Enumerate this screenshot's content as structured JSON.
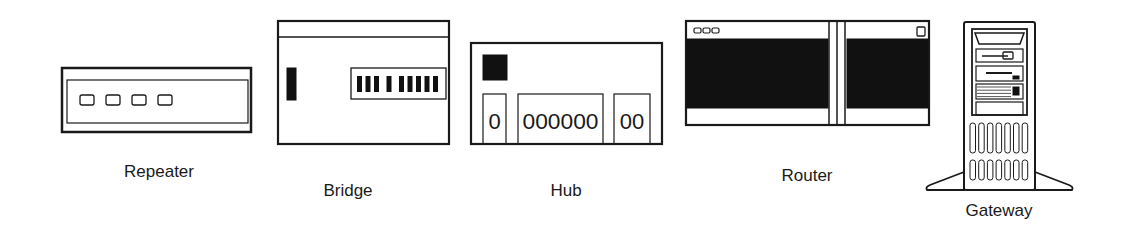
{
  "figure": {
    "colors": {
      "ink": "#1a1a1a",
      "background": "#ffffff",
      "panel_fill": "#111111"
    }
  },
  "devices": [
    {
      "id": "repeater",
      "label": "Repeater",
      "icon": "repeater-icon",
      "port_count": 4
    },
    {
      "id": "bridge",
      "label": "Bridge",
      "icon": "bridge-icon",
      "led_groups": [
        3,
        1,
        5
      ]
    },
    {
      "id": "hub",
      "label": "Hub",
      "icon": "hub-icon",
      "port_groups": [
        "0",
        "000000",
        "00"
      ]
    },
    {
      "id": "router",
      "label": "Router",
      "icon": "router-icon",
      "indicator_count": 3
    },
    {
      "id": "gateway",
      "label": "Gateway",
      "icon": "gateway-tower-icon",
      "vent_rows": 2,
      "vent_cols": 7
    }
  ]
}
